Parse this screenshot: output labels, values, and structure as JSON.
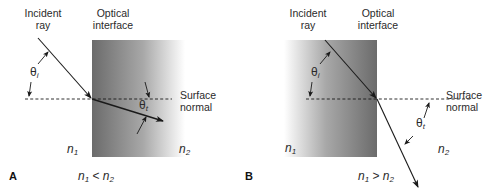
{
  "panels": [
    {
      "letter": "A",
      "incident_label_1": "Incident",
      "incident_label_2": "ray",
      "interface_label_1": "Optical",
      "interface_label_2": "interface",
      "normal_label_1": "Surface",
      "normal_label_2": "normal",
      "theta_i": "θ",
      "theta_i_sub": "i",
      "theta_t": "θ",
      "theta_t_sub": "t",
      "n1": "n",
      "n1_sub": "1",
      "n2": "n",
      "n2_sub": "2",
      "condition_left": "n",
      "condition_left_sub": "1",
      "condition_op": " < ",
      "condition_right": "n",
      "condition_right_sub": "2"
    },
    {
      "letter": "B",
      "incident_label_1": "Incident",
      "incident_label_2": "ray",
      "interface_label_1": "Optical",
      "interface_label_2": "interface",
      "normal_label_1": "Surface",
      "normal_label_2": "normal",
      "theta_i": "θ",
      "theta_i_sub": "i",
      "theta_t": "θ",
      "theta_t_sub": "t",
      "n1": "n",
      "n1_sub": "1",
      "n2": "n",
      "n2_sub": "2",
      "condition_left": "n",
      "condition_left_sub": "1",
      "condition_op": " > ",
      "condition_right": "n",
      "condition_right_sub": "2"
    }
  ],
  "colors": {
    "medium_dark": "#6e6e6e",
    "medium_light": "#ffffff",
    "line": "#1a1a1a"
  }
}
